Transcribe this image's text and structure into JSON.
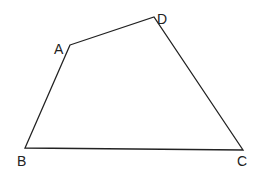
{
  "diagram": {
    "type": "quadrilateral",
    "stroke_color": "#222222",
    "background": "#ffffff",
    "vertices": [
      {
        "name": "A",
        "x": 70,
        "y": 45,
        "label_x": 54,
        "label_y": 54
      },
      {
        "name": "D",
        "x": 154,
        "y": 17,
        "label_x": 157,
        "label_y": 24
      },
      {
        "name": "C",
        "x": 243,
        "y": 150,
        "label_x": 237,
        "label_y": 166
      },
      {
        "name": "B",
        "x": 25,
        "y": 148,
        "label_x": 17,
        "label_y": 166
      }
    ],
    "edges": [
      [
        "A",
        "D"
      ],
      [
        "D",
        "C"
      ],
      [
        "C",
        "B"
      ],
      [
        "B",
        "A"
      ]
    ]
  }
}
